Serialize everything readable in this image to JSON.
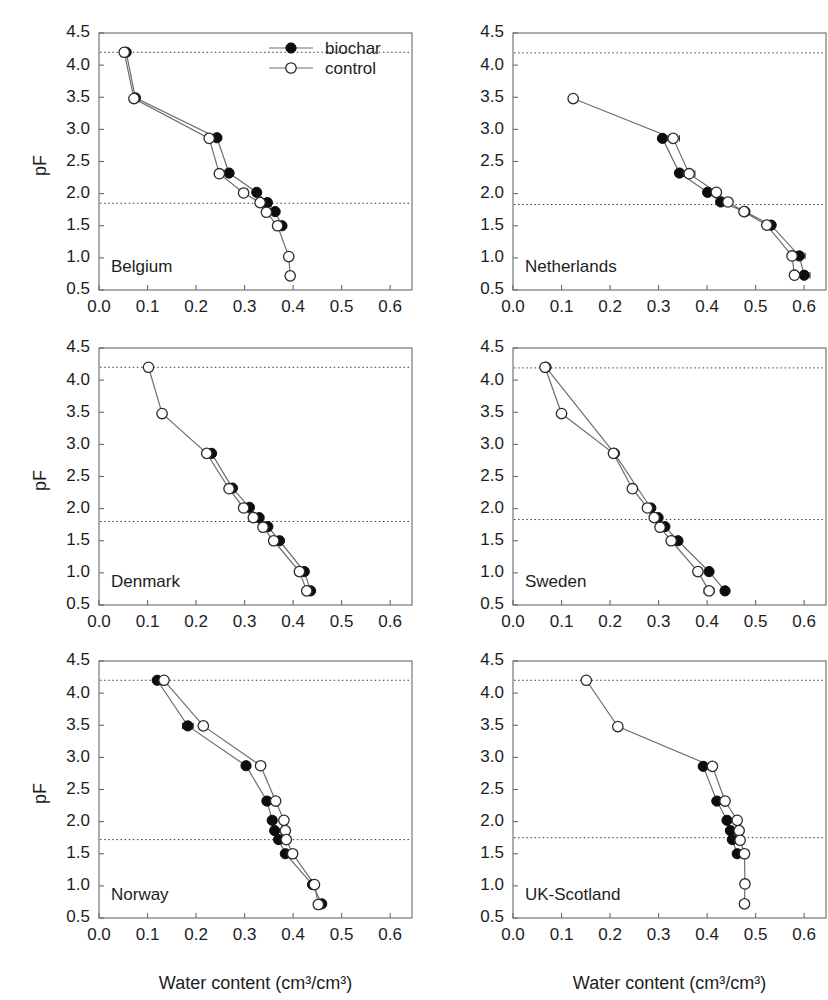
{
  "figure": {
    "x_axis_title": "Water content (cm³/cm³)",
    "y_axis_title": "pF",
    "x_ticks": [
      "0.0",
      "0.1",
      "0.2",
      "0.3",
      "0.4",
      "0.5",
      "0.6"
    ],
    "y_ticks": [
      "0.5",
      "1.0",
      "1.5",
      "2.0",
      "2.5",
      "3.0",
      "3.5",
      "4.0",
      "4.5"
    ],
    "legend": {
      "biochar_label": "biochar",
      "control_label": "control"
    },
    "colors": {
      "biochar_marker": "#0d0d0d",
      "control_marker": "#ffffff",
      "marker_stroke": "#2b2b2b",
      "line": "#6e6e6e",
      "frame": "#6a6a6a",
      "refline": "#3a3a3a",
      "background": "#ffffff"
    }
  },
  "chart_data": [
    {
      "type": "line",
      "title": "Belgium",
      "xlabel": "Water content (cm³/cm³)",
      "ylabel": "pF",
      "xlim": [
        0.0,
        0.645
      ],
      "ylim": [
        0.5,
        4.5
      ],
      "grid": false,
      "legend_position": "top-right",
      "reference_lines": [
        {
          "name": "wilting-point",
          "y": 4.2
        },
        {
          "name": "field-capacity",
          "y": 1.85
        }
      ],
      "series": [
        {
          "name": "biochar",
          "marker": "filled-circle",
          "points": [
            {
              "x": 0.056,
              "y": 4.2
            },
            {
              "x": 0.075,
              "y": 3.49
            },
            {
              "x": 0.243,
              "y": 2.87
            },
            {
              "x": 0.268,
              "y": 2.32
            },
            {
              "x": 0.325,
              "y": 2.02
            },
            {
              "x": 0.347,
              "y": 1.86
            },
            {
              "x": 0.363,
              "y": 1.72
            },
            {
              "x": 0.377,
              "y": 1.5
            }
          ]
        },
        {
          "name": "control",
          "marker": "open-circle",
          "points": [
            {
              "x": 0.052,
              "y": 4.2
            },
            {
              "x": 0.072,
              "y": 3.48
            },
            {
              "x": 0.227,
              "y": 2.86
            },
            {
              "x": 0.248,
              "y": 2.31
            },
            {
              "x": 0.298,
              "y": 2.01
            },
            {
              "x": 0.332,
              "y": 1.86
            },
            {
              "x": 0.345,
              "y": 1.71
            },
            {
              "x": 0.368,
              "y": 1.5
            },
            {
              "x": 0.391,
              "y": 1.02
            },
            {
              "x": 0.394,
              "y": 0.72
            }
          ]
        }
      ]
    },
    {
      "type": "line",
      "title": "Netherlands",
      "xlabel": "Water content (cm³/cm³)",
      "ylabel": "pF",
      "xlim": [
        0.0,
        0.645
      ],
      "ylim": [
        0.5,
        4.5
      ],
      "grid": false,
      "legend_position": "none",
      "reference_lines": [
        {
          "name": "wilting-point",
          "y": 4.19
        },
        {
          "name": "field-capacity",
          "y": 1.83
        }
      ],
      "series": [
        {
          "name": "biochar",
          "marker": "filled-circle",
          "points": [
            {
              "x": 0.308,
              "y": 2.86
            },
            {
              "x": 0.343,
              "y": 2.32
            },
            {
              "x": 0.401,
              "y": 2.02
            },
            {
              "x": 0.428,
              "y": 1.87
            },
            {
              "x": 0.478,
              "y": 1.72
            },
            {
              "x": 0.532,
              "y": 1.51
            },
            {
              "x": 0.59,
              "y": 1.03,
              "xerr": 0.012
            },
            {
              "x": 0.6,
              "y": 0.73,
              "xerr": 0.012
            }
          ]
        },
        {
          "name": "control",
          "marker": "open-circle",
          "points": [
            {
              "x": 0.124,
              "y": 3.48
            },
            {
              "x": 0.33,
              "y": 2.86,
              "xerr": 0.013
            },
            {
              "x": 0.363,
              "y": 2.31,
              "xerr": 0.012
            },
            {
              "x": 0.419,
              "y": 2.02,
              "xerr": 0.009
            },
            {
              "x": 0.443,
              "y": 1.87
            },
            {
              "x": 0.476,
              "y": 1.72
            },
            {
              "x": 0.523,
              "y": 1.51
            },
            {
              "x": 0.575,
              "y": 1.03
            },
            {
              "x": 0.58,
              "y": 0.73
            }
          ]
        }
      ]
    },
    {
      "type": "line",
      "title": "Denmark",
      "xlabel": "Water content (cm³/cm³)",
      "ylabel": "pF",
      "xlim": [
        0.0,
        0.645
      ],
      "ylim": [
        0.5,
        4.5
      ],
      "grid": false,
      "legend_position": "none",
      "reference_lines": [
        {
          "name": "wilting-point",
          "y": 4.2
        },
        {
          "name": "field-capacity",
          "y": 1.8
        }
      ],
      "series": [
        {
          "name": "biochar",
          "marker": "filled-circle",
          "points": [
            {
              "x": 0.232,
              "y": 2.86
            },
            {
              "x": 0.275,
              "y": 2.32
            },
            {
              "x": 0.31,
              "y": 2.02
            },
            {
              "x": 0.33,
              "y": 1.86
            },
            {
              "x": 0.348,
              "y": 1.72
            },
            {
              "x": 0.372,
              "y": 1.5
            },
            {
              "x": 0.423,
              "y": 1.02
            },
            {
              "x": 0.436,
              "y": 0.72
            }
          ]
        },
        {
          "name": "control",
          "marker": "open-circle",
          "points": [
            {
              "x": 0.102,
              "y": 4.2
            },
            {
              "x": 0.13,
              "y": 3.48
            },
            {
              "x": 0.222,
              "y": 2.86
            },
            {
              "x": 0.268,
              "y": 2.31
            },
            {
              "x": 0.298,
              "y": 2.01
            },
            {
              "x": 0.318,
              "y": 1.86
            },
            {
              "x": 0.338,
              "y": 1.71
            },
            {
              "x": 0.36,
              "y": 1.5
            },
            {
              "x": 0.413,
              "y": 1.02
            },
            {
              "x": 0.428,
              "y": 0.72
            }
          ]
        }
      ]
    },
    {
      "type": "line",
      "title": "Sweden",
      "xlabel": "Water content (cm³/cm³)",
      "ylabel": "pF",
      "xlim": [
        0.0,
        0.645
      ],
      "ylim": [
        0.5,
        4.5
      ],
      "grid": false,
      "legend_position": "none",
      "reference_lines": [
        {
          "name": "wilting-point",
          "y": 4.19
        },
        {
          "name": "field-capacity",
          "y": 1.83
        }
      ],
      "series": [
        {
          "name": "biochar",
          "marker": "filled-circle",
          "points": [
            {
              "x": 0.068,
              "y": 4.2
            },
            {
              "x": 0.209,
              "y": 2.86
            },
            {
              "x": 0.284,
              "y": 2.01
            },
            {
              "x": 0.299,
              "y": 1.86
            },
            {
              "x": 0.313,
              "y": 1.72
            },
            {
              "x": 0.34,
              "y": 1.5
            },
            {
              "x": 0.404,
              "y": 1.02
            },
            {
              "x": 0.437,
              "y": 0.72
            }
          ]
        },
        {
          "name": "control",
          "marker": "open-circle",
          "points": [
            {
              "x": 0.066,
              "y": 4.2
            },
            {
              "x": 0.1,
              "y": 3.48
            },
            {
              "x": 0.207,
              "y": 2.86
            },
            {
              "x": 0.246,
              "y": 2.31
            },
            {
              "x": 0.277,
              "y": 2.01
            },
            {
              "x": 0.291,
              "y": 1.86
            },
            {
              "x": 0.303,
              "y": 1.71
            },
            {
              "x": 0.326,
              "y": 1.5
            },
            {
              "x": 0.381,
              "y": 1.02
            },
            {
              "x": 0.404,
              "y": 0.72,
              "xerr": 0.01
            }
          ]
        }
      ]
    },
    {
      "type": "line",
      "title": "Norway",
      "xlabel": "Water content (cm³/cm³)",
      "ylabel": "pF",
      "xlim": [
        0.0,
        0.645
      ],
      "ylim": [
        0.5,
        4.5
      ],
      "grid": false,
      "legend_position": "none",
      "reference_lines": [
        {
          "name": "wilting-point",
          "y": 4.2
        },
        {
          "name": "field-capacity",
          "y": 1.72
        }
      ],
      "series": [
        {
          "name": "biochar",
          "marker": "filled-circle",
          "points": [
            {
              "x": 0.12,
              "y": 4.2
            },
            {
              "x": 0.183,
              "y": 3.49,
              "xerr": 0.011
            },
            {
              "x": 0.303,
              "y": 2.87
            },
            {
              "x": 0.346,
              "y": 2.32,
              "xerr": 0.009
            },
            {
              "x": 0.357,
              "y": 2.02,
              "xerr": 0.008
            },
            {
              "x": 0.362,
              "y": 1.86
            },
            {
              "x": 0.37,
              "y": 1.72
            },
            {
              "x": 0.384,
              "y": 1.5
            },
            {
              "x": 0.44,
              "y": 1.02
            },
            {
              "x": 0.459,
              "y": 0.72
            }
          ]
        },
        {
          "name": "control",
          "marker": "open-circle",
          "points": [
            {
              "x": 0.134,
              "y": 4.2
            },
            {
              "x": 0.215,
              "y": 3.49
            },
            {
              "x": 0.333,
              "y": 2.87
            },
            {
              "x": 0.364,
              "y": 2.32
            },
            {
              "x": 0.381,
              "y": 2.02
            },
            {
              "x": 0.384,
              "y": 1.86
            },
            {
              "x": 0.386,
              "y": 1.72
            },
            {
              "x": 0.399,
              "y": 1.5
            },
            {
              "x": 0.444,
              "y": 1.02
            },
            {
              "x": 0.452,
              "y": 0.71
            }
          ]
        }
      ]
    },
    {
      "type": "line",
      "title": "UK-Scotland",
      "xlabel": "Water content (cm³/cm³)",
      "ylabel": "pF",
      "xlim": [
        0.0,
        0.645
      ],
      "ylim": [
        0.5,
        4.5
      ],
      "grid": false,
      "legend_position": "none",
      "reference_lines": [
        {
          "name": "wilting-point",
          "y": 4.2
        },
        {
          "name": "field-capacity",
          "y": 1.75
        }
      ],
      "series": [
        {
          "name": "biochar",
          "marker": "filled-circle",
          "points": [
            {
              "x": 0.392,
              "y": 2.86
            },
            {
              "x": 0.42,
              "y": 2.32
            },
            {
              "x": 0.441,
              "y": 2.02
            },
            {
              "x": 0.448,
              "y": 1.86
            },
            {
              "x": 0.452,
              "y": 1.72
            },
            {
              "x": 0.462,
              "y": 1.5
            }
          ]
        },
        {
          "name": "control",
          "marker": "open-circle",
          "points": [
            {
              "x": 0.151,
              "y": 4.2
            },
            {
              "x": 0.216,
              "y": 3.48
            },
            {
              "x": 0.411,
              "y": 2.86
            },
            {
              "x": 0.437,
              "y": 2.32
            },
            {
              "x": 0.462,
              "y": 2.02
            },
            {
              "x": 0.466,
              "y": 1.86
            },
            {
              "x": 0.468,
              "y": 1.71
            },
            {
              "x": 0.477,
              "y": 1.5
            },
            {
              "x": 0.478,
              "y": 1.03,
              "xerr": 0.009
            },
            {
              "x": 0.477,
              "y": 0.72,
              "xerr": 0.009
            }
          ]
        }
      ]
    }
  ]
}
